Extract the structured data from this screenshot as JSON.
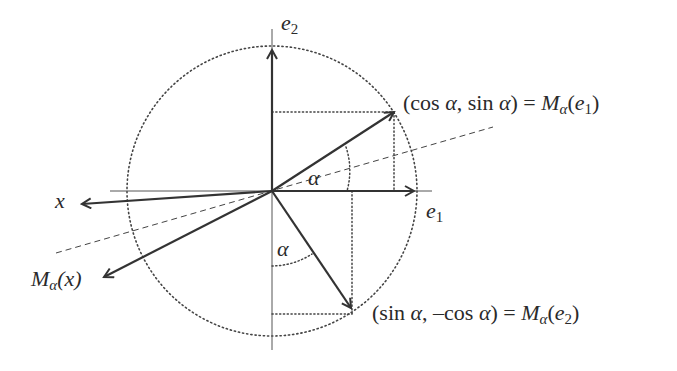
{
  "figure": {
    "type": "reflection-diagram",
    "colors": {
      "stroke": "#333333",
      "axis": "#555555",
      "background": "#ffffff"
    }
  },
  "labels": {
    "e2": {
      "base": "e",
      "sub": "2"
    },
    "e1": {
      "base": "e",
      "sub": "1"
    },
    "x": "x",
    "alpha_upper": "α",
    "alpha_lower": "α",
    "m_alpha_x": {
      "base": "M",
      "sub": "α",
      "arg": "(x)"
    },
    "point_e1": {
      "open": "(cos ",
      "alpha1": "α",
      "mid": ", sin ",
      "alpha2": "α",
      "close": ") = ",
      "M": "M",
      "sub": "α",
      "paren_open": "(",
      "e": "e",
      "e_sub": "1",
      "paren_close": ")"
    },
    "point_e2": {
      "open": "(sin ",
      "alpha1": "α",
      "mid": ", –cos ",
      "alpha2": "α",
      "close": ") = ",
      "M": "M",
      "sub": "α",
      "paren_open": "(",
      "e": "e",
      "e_sub": "2",
      "paren_close": ")"
    }
  },
  "geometry": {
    "origin": [
      272,
      191
    ],
    "radius": 145,
    "vectors": [
      {
        "name": "e1",
        "to": [
          414,
          191
        ]
      },
      {
        "name": "e2",
        "to": [
          272,
          50
        ]
      },
      {
        "name": "M_alpha_e1",
        "to": [
          394,
          112
        ]
      },
      {
        "name": "M_alpha_e2",
        "to": [
          351,
          308
        ]
      },
      {
        "name": "x",
        "to": [
          82,
          204
        ]
      },
      {
        "name": "M_alpha_x",
        "to": [
          104,
          277
        ]
      }
    ]
  }
}
